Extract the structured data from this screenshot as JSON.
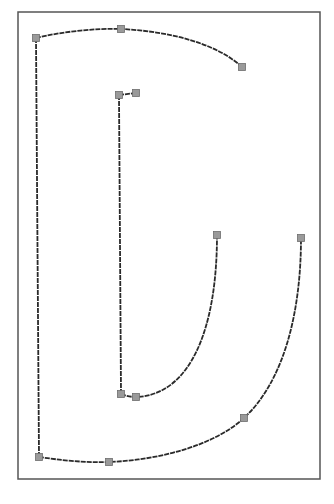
{
  "diagram": {
    "type": "glyph-outline",
    "colors": {
      "background": "#ffffff",
      "frame": "#555555",
      "stroke": "#2a2a2a",
      "point_fill": "#9a9a9a",
      "point_stroke": "#6e6e6e"
    },
    "frame": {
      "x": 18,
      "y": 12,
      "width": 302,
      "height": 467
    },
    "paths": [
      {
        "name": "outer-top-arc",
        "d": "M36,38 C60,32 95,28 121,29 C165,31 215,42 242,67"
      },
      {
        "name": "outer-left-stem",
        "d": "M36,38 L39,457"
      },
      {
        "name": "outer-bottom-bowl",
        "d": "M39,457 C60,460 85,463 109,462 C160,460 215,445 244,418 C285,380 301,310 301,238"
      },
      {
        "name": "inner-top-serif",
        "d": "M119,95 L136,93"
      },
      {
        "name": "inner-stem",
        "d": "M119,95 L121,394"
      },
      {
        "name": "inner-bowl",
        "d": "M121,394 C126,396 131,397 136,397 C190,395 217,330 217,235"
      }
    ],
    "points": [
      {
        "name": "outer-top-left",
        "x": 36,
        "y": 38
      },
      {
        "name": "outer-top-mid",
        "x": 121,
        "y": 29
      },
      {
        "name": "outer-top-end",
        "x": 242,
        "y": 67
      },
      {
        "name": "inner-top-left",
        "x": 119,
        "y": 95
      },
      {
        "name": "inner-top-right",
        "x": 136,
        "y": 93
      },
      {
        "name": "inner-right-top",
        "x": 217,
        "y": 235
      },
      {
        "name": "outer-right-top",
        "x": 301,
        "y": 238
      },
      {
        "name": "inner-bottom-left",
        "x": 121,
        "y": 394
      },
      {
        "name": "inner-bottom-mid",
        "x": 136,
        "y": 397
      },
      {
        "name": "outer-bottom-right",
        "x": 244,
        "y": 418
      },
      {
        "name": "outer-bottom-left",
        "x": 39,
        "y": 457
      },
      {
        "name": "outer-bottom-mid",
        "x": 109,
        "y": 462
      }
    ],
    "point_size": 7
  }
}
